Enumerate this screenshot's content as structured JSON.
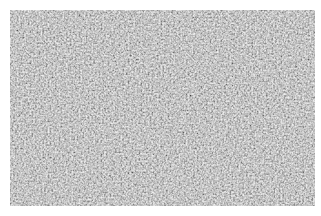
{
  "image": {
    "description": "Grayscale surface texture micrograph",
    "base_color": "#9a9a9a",
    "highlight_color": "#d8d8d8",
    "shadow_color": "#6e6e6e",
    "background": "#ffffff"
  }
}
